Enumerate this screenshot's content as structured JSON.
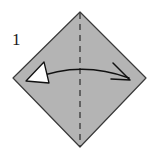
{
  "figure": {
    "step_label": "1",
    "background_color": "#ffffff"
  },
  "shape": {
    "name": "square-rotated-diamond",
    "fill_color": "#b4b4b4",
    "stroke_color": "#3a3a3a",
    "stroke_width": 1.2,
    "vertices": {
      "top": [
        80,
        12
      ],
      "right": [
        146,
        78
      ],
      "bottom": [
        80,
        147
      ],
      "left": [
        13,
        78
      ]
    }
  },
  "crease": {
    "name": "vertical-center-dashed-crease",
    "stroke_color": "#2b2b2b",
    "stroke_width": 1.2,
    "dash_pattern": "6 5",
    "x": 80,
    "y_start": 13,
    "y_end": 147
  },
  "arrow": {
    "name": "double-headed-fold-arrow",
    "stroke_color": "#111111",
    "stroke_width": 1.5,
    "path": "M 33 79 Q 80 60 129 78",
    "left_head": {
      "type": "hollow-triangle",
      "fill": "#ffffff",
      "stroke": "#111111",
      "points": "26,81 49,83 44,62"
    },
    "right_head": {
      "type": "open-line-barbs",
      "stroke": "#111111",
      "tip": [
        130,
        80
      ],
      "barb_points": "113,63 130,80 111,79"
    }
  }
}
